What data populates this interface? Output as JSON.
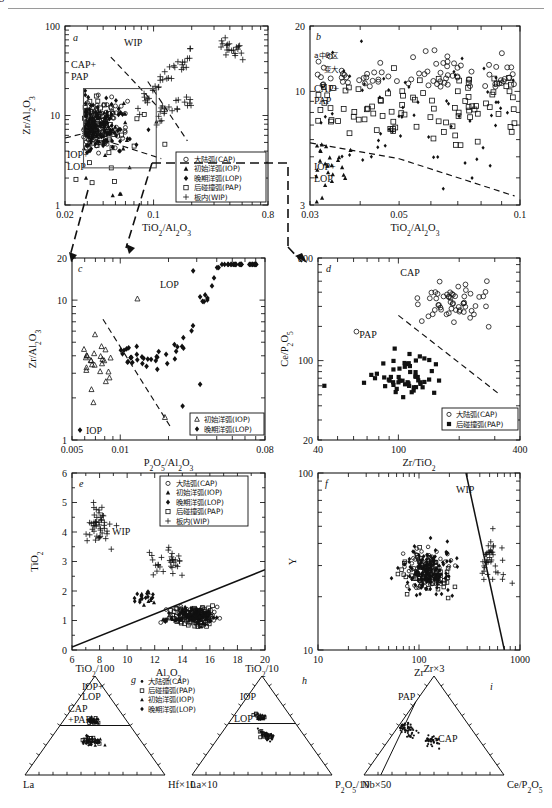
{
  "figure": {
    "panels": [
      "a",
      "b",
      "c",
      "d",
      "e",
      "f",
      "g",
      "h",
      "i"
    ]
  },
  "legend_series": {
    "cap": {
      "label": "大陆弧(CAP)",
      "marker": "open-circle"
    },
    "iop": {
      "label": "初始洋弧(IOP)",
      "marker": "filled-triangle"
    },
    "lop": {
      "label": "晚期洋弧(LOP)",
      "marker": "filled-diamond"
    },
    "pap": {
      "label": "后碰撞弧(PAP)",
      "marker": "open-square"
    },
    "wip": {
      "label": "板内(WIP)",
      "marker": "plus"
    },
    "iop_open": {
      "label": "初始洋弧(IOP)",
      "marker": "open-triangle"
    },
    "pap_filled": {
      "label": "后碰撞弧(PAP)",
      "marker": "filled-square"
    }
  },
  "chart_data": [
    {
      "id": "a",
      "type": "scatter",
      "panel_label": "a",
      "xlabel": "TiO₂/Al₂O₃",
      "ylabel": "Zr/Al₂O₃",
      "xscale": "log",
      "yscale": "log",
      "xlim": [
        0.02,
        0.8
      ],
      "ylim": [
        1,
        100
      ],
      "xticks": [
        "0.02",
        "0.1",
        "0.8"
      ],
      "yticks": [
        "1",
        "10",
        "100"
      ],
      "field_labels": [
        "WIP",
        "CAP+\nPAP",
        "IOP+\nLOP"
      ],
      "legend": [
        "cap",
        "iop",
        "lop",
        "pap",
        "wip"
      ],
      "inset_box_note": "grey rectangle marks region enlarged in panel b",
      "series": [
        {
          "name": "CAP+PAP+IOP+LOP cluster",
          "marker": "mixed",
          "n": 300,
          "x_range": [
            0.025,
            0.11
          ],
          "y_range": [
            2,
            20
          ]
        },
        {
          "name": "WIP",
          "marker": "plus",
          "n": 70,
          "x_range": [
            0.07,
            0.75
          ],
          "y_range": [
            9,
            90
          ]
        }
      ]
    },
    {
      "id": "b",
      "type": "scatter",
      "panel_label": "b",
      "xlabel": "TiO₂/Al₂O₃",
      "ylabel": "",
      "xscale": "log",
      "yscale": "log",
      "xlim": [
        0.03,
        0.1
      ],
      "ylim": [
        3,
        20
      ],
      "xticks": [
        "0.03",
        "0.05",
        "0.1"
      ],
      "yticks": [
        "3",
        "10",
        "20"
      ],
      "annotation": "a中B区\n变大",
      "field_labels": [
        "CAP+\nPAP",
        "IOP+\nLOP"
      ],
      "series": [
        {
          "name": "CAP",
          "marker": "open-circle",
          "n": 80,
          "y_range": [
            5,
            20
          ]
        },
        {
          "name": "PAP",
          "marker": "open-square",
          "n": 90,
          "y_range": [
            4,
            14
          ]
        },
        {
          "name": "LOP",
          "marker": "filled-diamond",
          "n": 60,
          "y_range": [
            3,
            16
          ]
        },
        {
          "name": "IOP",
          "marker": "filled-triangle",
          "n": 25,
          "y_range": [
            3,
            9
          ]
        }
      ]
    },
    {
      "id": "c",
      "type": "scatter",
      "panel_label": "c",
      "xlabel": "P₂O₅/Al₂O₃",
      "ylabel": "Zr/Al₂O₃",
      "xscale": "log",
      "yscale": "log",
      "xlim": [
        0.005,
        0.08
      ],
      "ylim": [
        1,
        20
      ],
      "xticks": [
        "0.005",
        "0.01",
        "0.08"
      ],
      "yticks": [
        "1",
        "10",
        "20"
      ],
      "field_labels": [
        "LOP",
        "IOP"
      ],
      "legend": [
        "iop_open",
        "lop"
      ],
      "series": [
        {
          "name": "IOP",
          "marker": "open-triangle",
          "n": 22,
          "x_range": [
            0.006,
            0.02
          ],
          "y_range": [
            1.5,
            10
          ]
        },
        {
          "name": "LOP",
          "marker": "filled-diamond",
          "n": 70,
          "x_range": [
            0.009,
            0.07
          ],
          "y_range": [
            1.8,
            17
          ]
        }
      ]
    },
    {
      "id": "d",
      "type": "scatter",
      "panel_label": "d",
      "xlabel": "Zr/TiO₂",
      "ylabel": "Ce/P₂O₅",
      "xscale": "log",
      "yscale": "log",
      "xlim": [
        40,
        400
      ],
      "ylim": [
        20,
        800
      ],
      "xticks": [
        "40",
        "100",
        "400"
      ],
      "yticks": [
        "20",
        "100",
        "800"
      ],
      "field_labels": [
        "CAP",
        "PAP"
      ],
      "legend": [
        "cap",
        "pap_filled"
      ],
      "series": [
        {
          "name": "CAP",
          "marker": "open-circle",
          "n": 55,
          "x_range": [
            55,
            380
          ],
          "y_range": [
            60,
            750
          ]
        },
        {
          "name": "PAP",
          "marker": "filled-square",
          "n": 55,
          "x_range": [
            42,
            330
          ],
          "y_range": [
            28,
            280
          ]
        }
      ]
    },
    {
      "id": "e",
      "type": "scatter",
      "panel_label": "e",
      "xlabel": "Al₂O₃",
      "ylabel": "TiO₂",
      "xscale": "linear",
      "yscale": "linear",
      "xlim": [
        6,
        20
      ],
      "ylim": [
        0,
        6
      ],
      "xticks": [
        "6",
        "8",
        "10",
        "12",
        "14",
        "16",
        "18",
        "20"
      ],
      "yticks": [
        "0",
        "1",
        "2",
        "3",
        "4",
        "5",
        "6"
      ],
      "field_labels": [
        "WIP"
      ],
      "legend": [
        "cap",
        "iop",
        "lop",
        "pap",
        "wip"
      ],
      "divider": "straight solid line from (6,0.1) to (20,2.7)",
      "series": [
        {
          "name": "WIP",
          "marker": "plus",
          "n": 70,
          "x_range": [
            7,
            16
          ],
          "y_range": [
            1.6,
            5.6
          ]
        },
        {
          "name": "arc rocks (CAP/PAP/IOP/LOP)",
          "marker": "mixed",
          "n": 230,
          "x_range": [
            10.5,
            20
          ],
          "y_range": [
            0.4,
            2.1
          ]
        }
      ]
    },
    {
      "id": "f",
      "type": "scatter",
      "panel_label": "f",
      "xlabel": "Zr",
      "ylabel": "Y",
      "xscale": "log",
      "yscale": "log",
      "xlim": [
        10,
        1000
      ],
      "ylim": [
        10,
        100
      ],
      "xticks": [
        "10",
        "100",
        "1000"
      ],
      "yticks": [
        "10",
        "100"
      ],
      "field_labels": [
        "WIP"
      ],
      "divider": "steep solid line from (290,100) to (700,10)",
      "series": [
        {
          "name": "arc rocks",
          "marker": "mixed",
          "n": 280,
          "x_range": [
            20,
            450
          ],
          "y_range": [
            13,
            60
          ]
        },
        {
          "name": "WIP",
          "marker": "plus",
          "n": 40,
          "x_range": [
            300,
            900
          ],
          "y_range": [
            18,
            60
          ]
        }
      ]
    },
    {
      "id": "g",
      "type": "ternary",
      "panel_label": "g",
      "apex_top": "TiO₂/100",
      "apex_left": "La",
      "apex_right": "Hf×10",
      "field_labels": [
        "IOP+\nLOP",
        "CAP\n+PAP"
      ],
      "legend": [
        "cap",
        "pap",
        "iop",
        "lop"
      ],
      "series": [
        {
          "name": "IOP+LOP",
          "marker": "mixed",
          "n": 35,
          "region": "upper-apex"
        },
        {
          "name": "CAP+PAP",
          "marker": "mixed",
          "n": 45,
          "region": "mid-centre"
        }
      ]
    },
    {
      "id": "h",
      "type": "ternary",
      "panel_label": "h",
      "apex_top": "TiO₂/10",
      "apex_left": "La×10",
      "apex_right": "P₂O₅/10",
      "field_labels": [
        "IOP",
        "LOP"
      ],
      "series": [
        {
          "name": "IOP",
          "marker": "mixed",
          "n": 35,
          "region": "upper-apex"
        },
        {
          "name": "LOP",
          "marker": "mixed",
          "n": 45,
          "region": "mid-centre"
        }
      ]
    },
    {
      "id": "i",
      "type": "ternary",
      "panel_label": "i",
      "apex_top": "Zr×3",
      "apex_left": "Nb×50",
      "apex_right": "Ce/P₂O₅",
      "field_labels": [
        "PAP",
        "CAP"
      ],
      "series": [
        {
          "name": "PAP",
          "marker": "filled-dot",
          "n": 50,
          "region": "left-band"
        },
        {
          "name": "CAP",
          "marker": "filled-dot",
          "n": 35,
          "region": "centre"
        }
      ]
    }
  ]
}
